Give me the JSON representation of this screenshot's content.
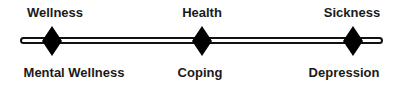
{
  "continuum": {
    "points": [
      {
        "top_label": "Wellness",
        "bottom_label": "Mental Wellness"
      },
      {
        "top_label": "Health",
        "bottom_label": "Coping"
      },
      {
        "top_label": "Sickness",
        "bottom_label": "Depression"
      }
    ],
    "line_color": "#111111",
    "marker_color": "#000000"
  }
}
